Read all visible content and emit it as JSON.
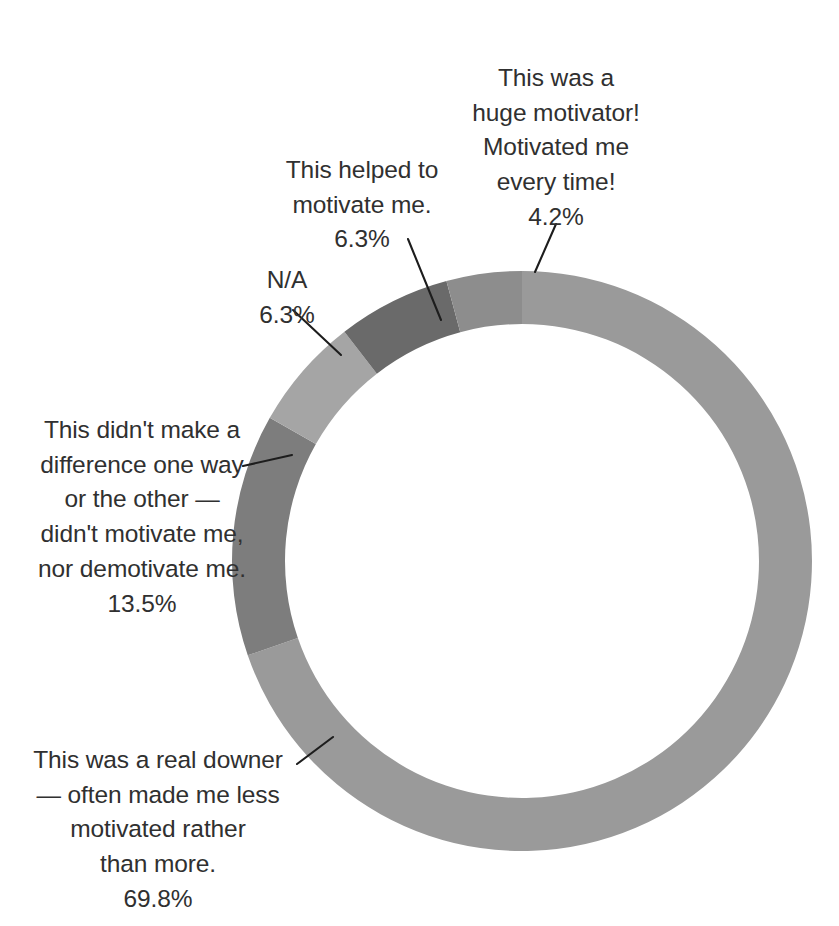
{
  "chart_data": {
    "type": "pie",
    "variant": "donut",
    "title": "",
    "subtitle": "",
    "xlabel": "",
    "ylabel": "",
    "legend": "none",
    "grid": false,
    "label_style": "outside-with-leader-lines",
    "value_unit": "percent",
    "start_angle_deg": 0,
    "direction": "clockwise",
    "categories": [
      "This was a real downer — often made me less motivated rather than more.",
      "This didn't make a difference one way or the other — didn't motivate me, nor demotivate me.",
      "N/A",
      "This helped to motivate me.",
      "This was a huge motivator! Motivated me every time!"
    ],
    "values": [
      69.8,
      13.5,
      6.3,
      6.3,
      4.2
    ],
    "value_labels": [
      "69.8%",
      "13.5%",
      "6.3%",
      "6.3%",
      "4.2%"
    ],
    "colors": [
      "#9a9a9a",
      "#7d7d7d",
      "#a5a5a5",
      "#6a6a6a",
      "#8d8d8d"
    ],
    "slices": [
      {
        "name": "real-downer",
        "label_lines": "This was a real downer\n— often made me less\nmotivated rather\nthan more.",
        "percent_label": "69.8%",
        "value": 69.8,
        "color": "#9a9a9a"
      },
      {
        "name": "no-difference",
        "label_lines": "This didn't make a\ndifference one way\nor the other —\ndidn't motivate me,\nnor demotivate me.",
        "percent_label": "13.5%",
        "value": 13.5,
        "color": "#7d7d7d"
      },
      {
        "name": "not-applicable",
        "label_lines": "N/A",
        "percent_label": "6.3%",
        "value": 6.3,
        "color": "#a5a5a5"
      },
      {
        "name": "helped-to-motivate",
        "label_lines": "This helped to\nmotivate me.",
        "percent_label": "6.3%",
        "value": 6.3,
        "color": "#6a6a6a"
      },
      {
        "name": "huge-motivator",
        "label_lines": "This was a\nhuge motivator!\nMotivated me\nevery time!",
        "percent_label": "4.2%",
        "value": 4.2,
        "color": "#8d8d8d"
      }
    ]
  }
}
